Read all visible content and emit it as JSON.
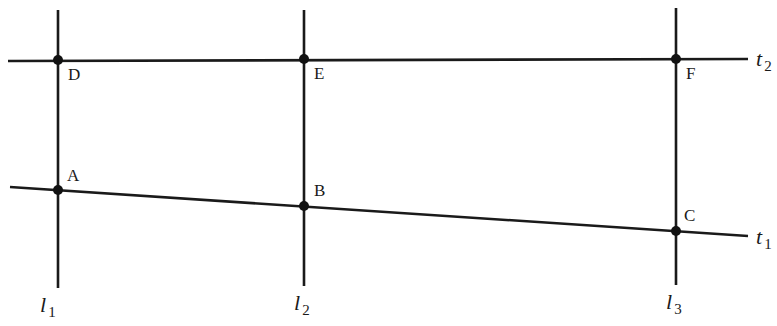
{
  "diagram": {
    "colors": {
      "line": "#1a1a1a",
      "point": "#111111",
      "background": "#ffffff"
    },
    "vertical_lines": [
      {
        "id": "l1",
        "label": "l",
        "subscript": "1",
        "x1": 58,
        "y1": 10,
        "x2": 58,
        "y2": 288,
        "label_x": 40,
        "label_y": 312
      },
      {
        "id": "l2",
        "label": "l",
        "subscript": "2",
        "x1": 304,
        "y1": 10,
        "x2": 304,
        "y2": 286,
        "label_x": 294,
        "label_y": 310
      },
      {
        "id": "l3",
        "label": "l",
        "subscript": "3",
        "x1": 676,
        "y1": 8,
        "x2": 676,
        "y2": 285,
        "label_x": 666,
        "label_y": 309
      }
    ],
    "transversals": [
      {
        "id": "t2",
        "label": "t",
        "subscript": "2",
        "x1": 8,
        "y1": 61,
        "x2": 748,
        "y2": 59,
        "label_x": 756,
        "label_y": 66
      },
      {
        "id": "t1",
        "label": "t",
        "subscript": "1",
        "x1": 10,
        "y1": 187,
        "x2": 748,
        "y2": 236,
        "label_x": 756,
        "label_y": 244
      }
    ],
    "points": [
      {
        "id": "D",
        "label": "D",
        "cx": 58,
        "cy": 60,
        "label_x": 68,
        "label_y": 80
      },
      {
        "id": "E",
        "label": "E",
        "cx": 304,
        "cy": 59,
        "label_x": 314,
        "label_y": 79
      },
      {
        "id": "F",
        "label": "F",
        "cx": 676,
        "cy": 59,
        "label_x": 686,
        "label_y": 79
      },
      {
        "id": "A",
        "label": "A",
        "cx": 58,
        "cy": 190,
        "label_x": 67,
        "label_y": 181
      },
      {
        "id": "B",
        "label": "B",
        "cx": 304,
        "cy": 206,
        "label_x": 314,
        "label_y": 196
      },
      {
        "id": "C",
        "label": "C",
        "cx": 676,
        "cy": 231,
        "label_x": 684,
        "label_y": 221
      }
    ]
  }
}
